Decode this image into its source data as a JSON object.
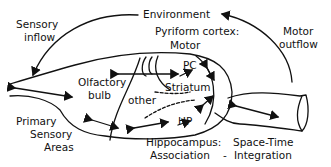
{
  "labels": {
    "environment": "Environment",
    "sensory_inflow_1": "Sensory",
    "sensory_inflow_2": "inflow",
    "pyriform_1": "Pyriform cortex:",
    "pyriform_2": "Motor",
    "motor_outflow_1": "Motor",
    "motor_outflow_2": "outflow",
    "pc": "PC",
    "olfactory_1": "Olfactory",
    "olfactory_2": "bulb",
    "striatum": "Striatum",
    "other": "other",
    "hp": "HP",
    "primary_1": "Primary",
    "primary_2": "Sensory",
    "primary_3": "Areas",
    "hippocampus_1": "Hippocampus:",
    "hippocampus_2": "Association",
    "dash": "-",
    "spacetime_1": "Space-Time",
    "spacetime_2": "Integration"
  },
  "colors": {
    "stroke": "#111111",
    "background": "#ffffff"
  }
}
